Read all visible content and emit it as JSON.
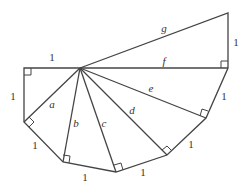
{
  "diagram": {
    "hub": [
      80,
      68
    ],
    "outer_vertices": [
      [
        24,
        68
      ],
      [
        24,
        122
      ],
      [
        63,
        162
      ],
      [
        116,
        172
      ],
      [
        167,
        155
      ],
      [
        206,
        118
      ],
      [
        228,
        68
      ],
      [
        228,
        13
      ]
    ],
    "right_angle_marks": [
      {
        "at": [
          24,
          68
        ]
      },
      {
        "at": [
          24,
          122
        ]
      },
      {
        "at": [
          63,
          162
        ]
      },
      {
        "at": [
          116,
          172
        ]
      },
      {
        "at": [
          167,
          155
        ]
      },
      {
        "at": [
          206,
          118
        ]
      },
      {
        "at": [
          228,
          68
        ]
      }
    ],
    "edge_labels": [
      {
        "text": "1",
        "x": 52,
        "y": 57,
        "italic": false
      },
      {
        "text": "1",
        "x": 13,
        "y": 96,
        "italic": false
      },
      {
        "text": "1",
        "x": 35,
        "y": 145,
        "italic": false
      },
      {
        "text": "1",
        "x": 85,
        "y": 177,
        "italic": false
      },
      {
        "text": "1",
        "x": 143,
        "y": 172,
        "italic": false
      },
      {
        "text": "1",
        "x": 191,
        "y": 144,
        "italic": false
      },
      {
        "text": "1",
        "x": 224,
        "y": 96,
        "italic": false
      },
      {
        "text": "1",
        "x": 236,
        "y": 42,
        "italic": false
      }
    ],
    "spoke_labels": [
      {
        "text": "a",
        "x": 52,
        "y": 104,
        "italic": true
      },
      {
        "text": "b",
        "x": 76,
        "y": 123,
        "italic": true
      },
      {
        "text": "c",
        "x": 104,
        "y": 123,
        "italic": true
      },
      {
        "text": "d",
        "x": 132,
        "y": 110,
        "italic": true
      },
      {
        "text": "e",
        "x": 151,
        "y": 88,
        "italic": true
      },
      {
        "text": "f",
        "x": 164,
        "y": 61,
        "italic": true
      },
      {
        "text": "g",
        "x": 164,
        "y": 28,
        "italic": true
      }
    ]
  }
}
